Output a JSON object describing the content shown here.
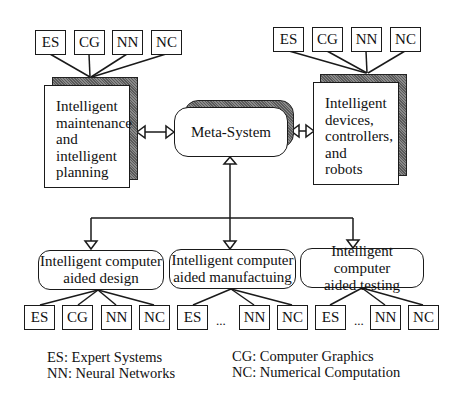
{
  "diagram": {
    "meta_system": {
      "label": "Meta-System"
    },
    "top_left_panel": {
      "lines": [
        "Intelligent",
        "maintenance",
        "and",
        "intelligent",
        "planning"
      ],
      "tags": [
        "ES",
        "CG",
        "NN",
        "NC"
      ]
    },
    "top_right_panel": {
      "lines": [
        "Intelligent",
        "devices,",
        "controllers,",
        "and",
        "robots"
      ],
      "tags": [
        "ES",
        "CG",
        "NN",
        "NC"
      ]
    },
    "modules": [
      {
        "line1": "Intelligent computer",
        "line2": "aided design",
        "tags": [
          "ES",
          "CG",
          "NN",
          "NC"
        ],
        "ellipsis": ""
      },
      {
        "line1": "Intelligent computer",
        "line2": "aided manufactuing",
        "tags": [
          "ES",
          "NN",
          "NC"
        ],
        "ellipsis": "..."
      },
      {
        "line1": "Intelligent computer",
        "line2": "aided testing",
        "tags": [
          "ES",
          "NN",
          "NC"
        ],
        "ellipsis": "..."
      }
    ],
    "legend": {
      "left": [
        "ES: Expert Systems",
        "NN: Neural Networks"
      ],
      "right": [
        "CG: Computer Graphics",
        "NC: Numerical Computation"
      ]
    }
  }
}
